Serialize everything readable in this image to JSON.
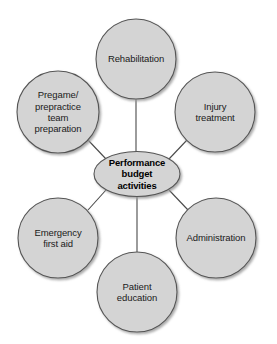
{
  "diagram": {
    "title": "Performance budget activities",
    "type": "hub-and-spoke",
    "canvas": {
      "width": 277,
      "height": 344,
      "background": "#ffffff"
    },
    "style": {
      "node_fill": "#d4d4d4",
      "node_stroke": "#555555",
      "connector_color": "#4a4a4a",
      "shadow_color": "#b0b0b0",
      "text_color": "#1a1a1a"
    },
    "hub": {
      "label": "Performance\nbudget\nactivities",
      "shape": "ellipse",
      "cx": 137,
      "cy": 174,
      "rx": 43,
      "ry": 22.5
    },
    "nodes": [
      {
        "id": "rehabilitation",
        "label": "Rehabilitation",
        "shape": "circle",
        "cx": 136,
        "cy": 59,
        "r": 40,
        "position": "top"
      },
      {
        "id": "pregame-preparation",
        "label": "Pregame/\nprepractice\nteam\npreparation",
        "shape": "circle",
        "cx": 58,
        "cy": 112,
        "r": 41,
        "position": "upper-left"
      },
      {
        "id": "injury-treatment",
        "label": "Injury\ntreatment",
        "shape": "circle",
        "cx": 215,
        "cy": 112,
        "r": 40,
        "position": "upper-right"
      },
      {
        "id": "emergency-first-aid",
        "label": "Emergency\nfirst aid",
        "shape": "circle",
        "cx": 58,
        "cy": 238,
        "r": 40,
        "position": "lower-left"
      },
      {
        "id": "administration",
        "label": "Administration",
        "shape": "circle",
        "cx": 216,
        "cy": 238,
        "r": 40,
        "position": "lower-right"
      },
      {
        "id": "patient-education",
        "label": "Patient\neducation",
        "shape": "circle",
        "cx": 137,
        "cy": 292,
        "r": 40,
        "position": "bottom"
      }
    ],
    "connectors": [
      {
        "from": "hub",
        "to": "rehabilitation"
      },
      {
        "from": "hub",
        "to": "pregame-preparation"
      },
      {
        "from": "hub",
        "to": "injury-treatment"
      },
      {
        "from": "hub",
        "to": "emergency-first-aid"
      },
      {
        "from": "hub",
        "to": "administration"
      },
      {
        "from": "hub",
        "to": "patient-education"
      }
    ]
  }
}
